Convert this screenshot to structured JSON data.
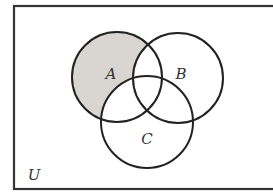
{
  "diagram": {
    "type": "venn",
    "universe": {
      "label": "U",
      "x": 14,
      "y": 6,
      "width": 270,
      "height": 183
    },
    "sets": [
      {
        "id": "A",
        "label": "A",
        "cx": 117,
        "cy": 77,
        "r": 45,
        "label_x": 111,
        "label_y": 79
      },
      {
        "id": "B",
        "label": "B",
        "cx": 178,
        "cy": 78,
        "r": 45,
        "label_x": 181,
        "label_y": 79
      },
      {
        "id": "C",
        "label": "C",
        "cx": 147,
        "cy": 122,
        "r": 46,
        "label_x": 147,
        "label_y": 144
      }
    ],
    "shaded_region": "A only (A minus B minus C)",
    "colors": {
      "shade": "#d9d6d2",
      "stroke": "#222222",
      "background": "#ffffff"
    }
  }
}
